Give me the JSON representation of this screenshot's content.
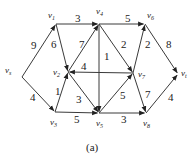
{
  "figure": {
    "caption": "(a)",
    "nodes": [
      {
        "id": "vs",
        "label": "v",
        "sub": "s",
        "x": 22,
        "y": 77,
        "lx": 5,
        "ly": 73
      },
      {
        "id": "v1",
        "label": "v",
        "sub": "1",
        "x": 56,
        "y": 24,
        "lx": 48,
        "ly": 18
      },
      {
        "id": "v2",
        "label": "v",
        "sub": "2",
        "x": 68,
        "y": 72,
        "lx": 53,
        "ly": 75
      },
      {
        "id": "v3",
        "label": "v",
        "sub": "3",
        "x": 55,
        "y": 112,
        "lx": 50,
        "ly": 125
      },
      {
        "id": "v4",
        "label": "v",
        "sub": "4",
        "x": 99,
        "y": 24,
        "lx": 96,
        "ly": 14
      },
      {
        "id": "v5",
        "label": "v",
        "sub": "5",
        "x": 99,
        "y": 113,
        "lx": 96,
        "ly": 126
      },
      {
        "id": "v6",
        "label": "v",
        "sub": "6",
        "x": 145,
        "y": 24,
        "lx": 147,
        "ly": 18
      },
      {
        "id": "v7",
        "label": "v",
        "sub": "7",
        "x": 133,
        "y": 73,
        "lx": 138,
        "ly": 77
      },
      {
        "id": "v8",
        "label": "v",
        "sub": "8",
        "x": 146,
        "y": 113,
        "lx": 143,
        "ly": 126
      },
      {
        "id": "vt",
        "label": "v",
        "sub": "t",
        "x": 178,
        "y": 74,
        "lx": 181,
        "ly": 76
      }
    ],
    "edges": [
      {
        "from": "vs",
        "to": "v1",
        "weight": "9",
        "wx": 31,
        "wy": 49
      },
      {
        "from": "vs",
        "to": "v3",
        "weight": "4",
        "wx": 30,
        "wy": 101
      },
      {
        "from": "v1",
        "to": "v4",
        "weight": "3",
        "wx": 75,
        "wy": 22
      },
      {
        "from": "v1",
        "to": "v2",
        "weight": "6",
        "wx": 51,
        "wy": 48
      },
      {
        "from": "v2",
        "to": "v4",
        "weight": "7",
        "wx": 79,
        "wy": 48
      },
      {
        "from": "v3",
        "to": "v2",
        "weight": "1",
        "wx": 55,
        "wy": 95
      },
      {
        "from": "v7",
        "to": "v2",
        "weight": "4",
        "wx": 81,
        "wy": 70
      },
      {
        "from": "v2",
        "to": "v5",
        "weight": "3",
        "wx": 76,
        "wy": 103
      },
      {
        "from": "v4",
        "to": "v5",
        "weight": "1",
        "wx": 104,
        "wy": 60
      },
      {
        "from": "v4",
        "to": "v7",
        "weight": "2",
        "wx": 121,
        "wy": 48
      },
      {
        "from": "v4",
        "to": "v6",
        "weight": "5",
        "wx": 125,
        "wy": 22
      },
      {
        "from": "v7",
        "to": "v6",
        "weight": "2",
        "wx": 145,
        "wy": 48
      },
      {
        "from": "v6",
        "to": "vt",
        "weight": "8",
        "wx": 166,
        "wy": 48
      },
      {
        "from": "v3",
        "to": "v5",
        "weight": "5",
        "wx": 74,
        "wy": 123
      },
      {
        "from": "v5",
        "to": "v7",
        "weight": "5",
        "wx": 120,
        "wy": 99
      },
      {
        "from": "v5",
        "to": "v8",
        "weight": "3",
        "wx": 121,
        "wy": 123
      },
      {
        "from": "v7",
        "to": "v8",
        "weight": "7",
        "wx": 145,
        "wy": 98
      },
      {
        "from": "v8",
        "to": "vt",
        "weight": "4",
        "wx": 168,
        "wy": 101
      }
    ]
  }
}
